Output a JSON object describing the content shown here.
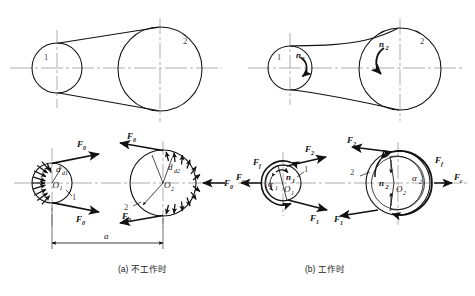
{
  "figure": {
    "type": "belt-drive-force-diagram",
    "background": "#ffffff",
    "line_color": "#111111",
    "centerline_color": "#8a8a8a",
    "panels": [
      {
        "id": "a",
        "caption": "(a) 不工作时",
        "caption_label": "(a)",
        "caption_text": "不工作时",
        "meaning": "at rest / not working"
      },
      {
        "id": "b",
        "caption": "(b) 工作时",
        "caption_label": "(b)",
        "caption_text": "工作时",
        "meaning": "in operation / working"
      }
    ],
    "labels": {
      "pulley_small": "1",
      "pulley_large": "2",
      "center_small": "O",
      "center_small_sub": "1",
      "center_large": "O",
      "center_large_sub": "2",
      "speed_small": "n",
      "speed_small_sub": "1",
      "speed_large": "n",
      "speed_large_sub": "2",
      "dia_small": "d",
      "dia_small_sub": "d1",
      "dia_large": "d",
      "dia_large_sub": "d2",
      "center_distance": "a",
      "initial_tension": "F",
      "initial_tension_sub": "0",
      "tight_side": "F",
      "tight_side_sub": "2",
      "slack_side": "F",
      "slack_side_sub": "1",
      "friction": "F",
      "friction_sub": "f",
      "centrifugal": "F",
      "centrifugal_sub": "c",
      "wrap_small": "α",
      "wrap_small_sub": "1",
      "wrap_large": "α",
      "wrap_large_sub": "2"
    },
    "geometry": {
      "top_left_small_pulley": {
        "cx": 57,
        "cy": 68,
        "r": 25
      },
      "top_left_large_pulley": {
        "cx": 160,
        "cy": 69,
        "r": 42
      },
      "top_right_small_pulley": {
        "cx": 290,
        "cy": 68,
        "r": 22
      },
      "top_right_large_pulley": {
        "cx": 400,
        "cy": 69,
        "r": 41
      },
      "bot_left_small_pulley": {
        "cx": 52,
        "cy": 183,
        "r": 20
      },
      "bot_left_large_pulley": {
        "cx": 163,
        "cy": 183,
        "r": 33
      },
      "bot_right_small_pulley": {
        "cx": 283,
        "cy": 183,
        "r": 18
      },
      "bot_right_large_pulley": {
        "cx": 398,
        "cy": 183,
        "r": 32
      }
    }
  }
}
